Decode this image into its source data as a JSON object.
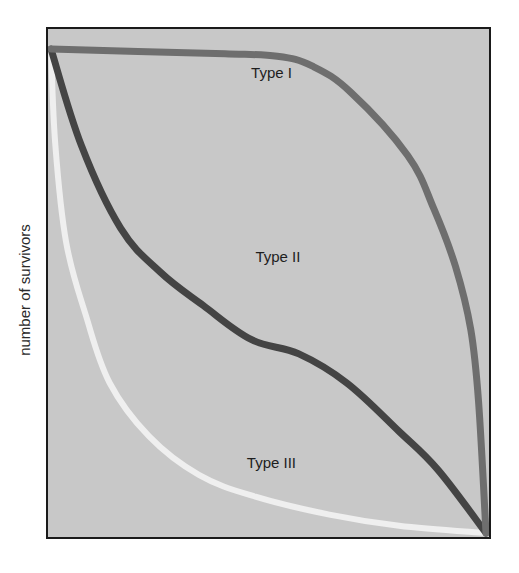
{
  "chart_data": {
    "type": "line",
    "title": "",
    "xlabel": "",
    "ylabel": "number of survivors",
    "xlim": [
      0,
      1
    ],
    "ylim": [
      0,
      1
    ],
    "grid": false,
    "legend": "none (inline labels)",
    "background_color": "#c8c8c8",
    "series": [
      {
        "name": "Type I",
        "color": "#6e6e6e",
        "x": [
          0.0,
          0.2,
          0.4,
          0.52,
          0.6,
          0.69,
          0.82,
          0.88,
          0.93,
          0.965,
          0.983,
          1.0
        ],
        "y": [
          1.0,
          0.995,
          0.99,
          0.985,
          0.965,
          0.91,
          0.78,
          0.67,
          0.55,
          0.42,
          0.27,
          0.0
        ]
      },
      {
        "name": "Type II",
        "color": "#444444",
        "x": [
          0.0,
          0.07,
          0.16,
          0.25,
          0.35,
          0.46,
          0.57,
          0.68,
          0.8,
          0.89,
          1.0
        ],
        "y": [
          1.0,
          0.8,
          0.63,
          0.54,
          0.47,
          0.4,
          0.37,
          0.31,
          0.21,
          0.13,
          0.0
        ]
      },
      {
        "name": "Type III",
        "color": "#efefef",
        "x": [
          0.0,
          0.01,
          0.035,
          0.08,
          0.135,
          0.225,
          0.34,
          0.47,
          0.64,
          0.8,
          1.0
        ],
        "y": [
          1.0,
          0.8,
          0.6,
          0.45,
          0.31,
          0.2,
          0.12,
          0.075,
          0.038,
          0.015,
          0.0
        ]
      }
    ],
    "annotations": [
      {
        "text": "Type I",
        "series": "Type I",
        "x": 0.46,
        "y": 0.94
      },
      {
        "text": "Type II",
        "series": "Type II",
        "x": 0.47,
        "y": 0.56
      },
      {
        "text": "Type III",
        "series": "Type III",
        "x": 0.45,
        "y": 0.135
      }
    ]
  }
}
